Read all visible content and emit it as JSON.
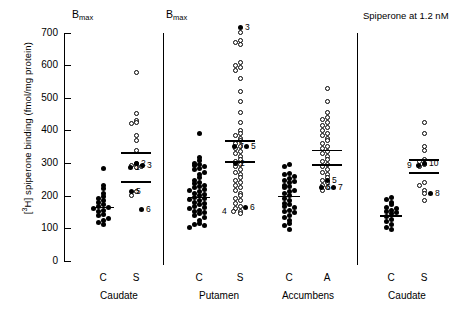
{
  "figure": {
    "ylabel_prefix": "[",
    "ylabel_sup": "3",
    "ylabel_rest": "H] spiperone binding (fmol/mg protein)",
    "bmax_left": "B",
    "bmax_sub": "max",
    "right_note": "Spiperone at 1.2 nM"
  },
  "chart_data": {
    "type": "scatter",
    "title": "",
    "xlabel": "",
    "ylabel": "[3H] spiperone binding (fmol/mg protein)",
    "ylim": [
      0,
      700
    ],
    "yticks": [
      0,
      100,
      200,
      300,
      400,
      500,
      600,
      700
    ],
    "ytick_labels": [
      "0",
      "100",
      "200",
      "300",
      "400",
      "500",
      "600",
      "700"
    ],
    "grid": false,
    "legend": "none",
    "panels": [
      {
        "name": "panel-bmax-caudate",
        "header": "Bmax",
        "region_labels": [
          "Caudate"
        ],
        "groups": [
          {
            "label": "C",
            "region": "Caudate",
            "marker": "filled",
            "mean": 166,
            "values": [
              283,
              232,
              221,
              207,
              198,
              191,
              186,
              178,
              172,
              168,
              165,
              160,
              156,
              151,
              143,
              138,
              131,
              124,
              118,
              112
            ]
          },
          {
            "label": "S",
            "region": "Caudate",
            "marker": "open",
            "mean": 333,
            "mean2": 244,
            "values": [
              577,
              452,
              430,
              424,
              420,
              384,
              369,
              340,
              300,
              296,
              292,
              288,
              285,
              214,
              202
            ],
            "numbered": [
              {
                "id": "2",
                "value": 300,
                "marker": "filled"
              },
              {
                "id": "1",
                "value": 285,
                "marker": "filled"
              },
              {
                "id": "3",
                "value": 292,
                "marker": "filled"
              },
              {
                "id": "5",
                "value": 214,
                "marker": "filled"
              },
              {
                "id": "6",
                "value": 158,
                "marker": "filled"
              }
            ]
          }
        ]
      },
      {
        "name": "panel-bmax-putamen-accumbens",
        "header": "Bmax",
        "region_labels": [
          "Putamen",
          "Accumbens"
        ],
        "groups": [
          {
            "label": "C",
            "region": "Putamen",
            "marker": "filled",
            "mean": 196,
            "values": [
              390,
              316,
              308,
              300,
              296,
              292,
              288,
              284,
              280,
              272,
              264,
              256,
              248,
              240,
              236,
              232,
              228,
              224,
              220,
              216,
              212,
              208,
              204,
              200,
              196,
              192,
              188,
              184,
              180,
              176,
              172,
              168,
              164,
              160,
              156,
              152,
              148,
              144,
              140,
              132,
              124,
              116,
              112,
              108,
              104
            ]
          },
          {
            "label": "S",
            "region": "Putamen",
            "marker": "open",
            "mean": 370,
            "mean2": 305,
            "values": [
              700,
              676,
              670,
              664,
              608,
              600,
              592,
              584,
              560,
              520,
              488,
              456,
              424,
              400,
              392,
              384,
              376,
              368,
              360,
              352,
              344,
              336,
              328,
              320,
              312,
              304,
              296,
              288,
              280,
              272,
              264,
              256,
              248,
              240,
              232,
              224,
              216,
              208,
              200,
              192,
              184,
              176,
              168,
              160,
              152,
              144
            ],
            "numbered": [
              {
                "id": "3",
                "value": 716,
                "marker": "filled"
              },
              {
                "id": "7",
                "value": 352,
                "marker": "filled"
              },
              {
                "id": "5",
                "value": 352,
                "marker": "filled"
              },
              {
                "id": "2",
                "value": 300,
                "marker": "filled"
              },
              {
                "id": "6",
                "value": 164,
                "marker": "filled"
              },
              {
                "id": "4",
                "value": 152,
                "marker": "open"
              }
            ]
          },
          {
            "label": "C",
            "region": "Accumbens",
            "marker": "filled",
            "mean": 200,
            "values": [
              296,
              288,
              268,
              264,
              260,
              252,
              248,
              244,
              240,
              232,
              228,
              224,
              216,
              212,
              208,
              200,
              192,
              184,
              176,
              172,
              168,
              164,
              156,
              152,
              148,
              140,
              132,
              124,
              116,
              108,
              96
            ]
          },
          {
            "label": "A",
            "region": "Accumbens",
            "marker": "open",
            "mean": 340,
            "mean2": 296,
            "values": [
              528,
              488,
              456,
              440,
              432,
              424,
              416,
              408,
              400,
              392,
              384,
              376,
              368,
              360,
              352,
              344,
              336,
              328,
              320,
              312,
              304,
              296,
              288,
              280,
              272,
              264,
              256,
              248,
              240,
              232,
              224,
              216
            ],
            "numbered": [
              {
                "id": "5",
                "value": 248,
                "marker": "filled"
              },
              {
                "id": "6",
                "value": 224,
                "marker": "filled"
              },
              {
                "id": "7",
                "value": 224,
                "marker": "filled"
              }
            ]
          }
        ]
      },
      {
        "name": "panel-spiperone-caudate",
        "header": "Spiperone at 1.2 nM",
        "region_labels": [
          "Caudate"
        ],
        "groups": [
          {
            "label": "C",
            "region": "Caudate",
            "marker": "filled",
            "mean": 140,
            "values": [
              196,
              188,
              180,
              172,
              164,
              160,
              156,
              152,
              148,
              144,
              136,
              128,
              120,
              112,
              104,
              96
            ]
          },
          {
            "label": "S",
            "region": "Caudate",
            "marker": "open",
            "mean": 312,
            "mean2": 272,
            "values": [
              424,
              392,
              352,
              340,
              312,
              304,
              296,
              288,
              240,
              232,
              216,
              208,
              184
            ],
            "numbered": [
              {
                "id": "10",
                "value": 300,
                "marker": "filled"
              },
              {
                "id": "9",
                "value": 292,
                "marker": "filled"
              },
              {
                "id": "8",
                "value": 208,
                "marker": "filled"
              }
            ]
          }
        ]
      }
    ]
  }
}
